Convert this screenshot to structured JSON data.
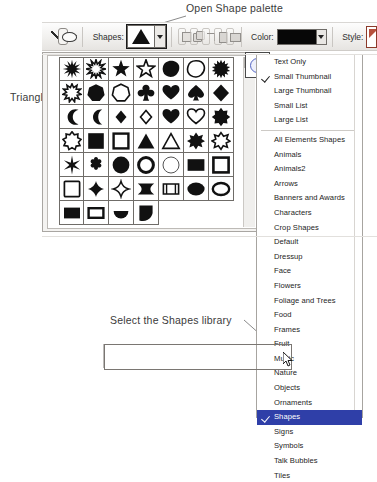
{
  "annotations": {
    "open_palette": "Open Shape palette",
    "triangle": "Triangle",
    "select_library": "Select the Shapes library"
  },
  "toolbar": {
    "shapes_label": "Shapes:",
    "color_label": "Color:",
    "style_label": "Style:",
    "color_value": "#070707",
    "selected_shape": "triangle",
    "line_tool_name": "line-tool",
    "blob_tool_name": "custom-shape-tool",
    "geometry_buttons": [
      "new-shape",
      "add-to-shape",
      "subtract-from-shape",
      "intersect-shape",
      "exclude-shape"
    ]
  },
  "palette": {
    "menu_button": "palette-menu-button",
    "columns": 7,
    "shapes": [
      "starburst-12-point",
      "sunburst-outline",
      "star-5-point-solid",
      "star-5-point-outline",
      "blob-solid",
      "blob-outline",
      "starburst-solid",
      "gear-sun",
      "heptagon-solid",
      "heptagon-outline",
      "club",
      "heart-solid",
      "spade",
      "diamond-solid",
      "crescent-moon-thick",
      "crescent-moon-thin",
      "diamond-small-solid",
      "diamond-small-outline",
      "heart-filled",
      "heart-outline",
      "flower-solid",
      "scalloped-circle-outline",
      "square-solid",
      "square-outline",
      "triangle-solid",
      "triangle-outline",
      "splat-solid",
      "splat-outline",
      "asterisk-6-point",
      "flower-6-petal",
      "circle-solid",
      "circle-ring",
      "circle-outline-thin",
      "rectangle-solid",
      "rectangle-outline",
      "square-rounded-outline",
      "diamond-rounded-solid",
      "diamond-rounded-outline",
      "bowtie-horizontal-solid",
      "bowtie-horizontal-outline",
      "ellipse-solid",
      "ellipse-outline",
      "rectangle-small-solid",
      "rectangle-small-outline",
      "half-circle-solid",
      "quarter-circle-solid"
    ]
  },
  "menu": {
    "view_options": [
      {
        "label": "Text Only",
        "checked": false
      },
      {
        "label": "Small Thumbnail",
        "checked": true
      },
      {
        "label": "Large Thumbnail",
        "checked": false
      },
      {
        "label": "Small List",
        "checked": false
      },
      {
        "label": "Large List",
        "checked": false
      }
    ],
    "libraries": [
      {
        "label": "All Elements Shapes",
        "checked": false,
        "selected": false
      },
      {
        "label": "Animals",
        "checked": false,
        "selected": false
      },
      {
        "label": "Animals2",
        "checked": false,
        "selected": false
      },
      {
        "label": "Arrows",
        "checked": false,
        "selected": false
      },
      {
        "label": "Banners and Awards",
        "checked": false,
        "selected": false
      },
      {
        "label": "Characters",
        "checked": false,
        "selected": false
      },
      {
        "label": "Crop Shapes",
        "checked": false,
        "selected": false
      },
      {
        "label": "Default",
        "checked": false,
        "selected": false
      },
      {
        "label": "Dressup",
        "checked": false,
        "selected": false
      },
      {
        "label": "Face",
        "checked": false,
        "selected": false
      },
      {
        "label": "Flowers",
        "checked": false,
        "selected": false
      },
      {
        "label": "Foliage and Trees",
        "checked": false,
        "selected": false
      },
      {
        "label": "Food",
        "checked": false,
        "selected": false
      },
      {
        "label": "Frames",
        "checked": false,
        "selected": false
      },
      {
        "label": "Fruit",
        "checked": false,
        "selected": false
      },
      {
        "label": "Music",
        "checked": false,
        "selected": false
      },
      {
        "label": "Nature",
        "checked": false,
        "selected": false
      },
      {
        "label": "Objects",
        "checked": false,
        "selected": false
      },
      {
        "label": "Ornaments",
        "checked": false,
        "selected": false
      },
      {
        "label": "Shapes",
        "checked": true,
        "selected": true
      },
      {
        "label": "Signs",
        "checked": false,
        "selected": false
      },
      {
        "label": "Symbols",
        "checked": false,
        "selected": false
      },
      {
        "label": "Talk Bubbles",
        "checked": false,
        "selected": false
      },
      {
        "label": "Tiles",
        "checked": false,
        "selected": false
      }
    ]
  }
}
